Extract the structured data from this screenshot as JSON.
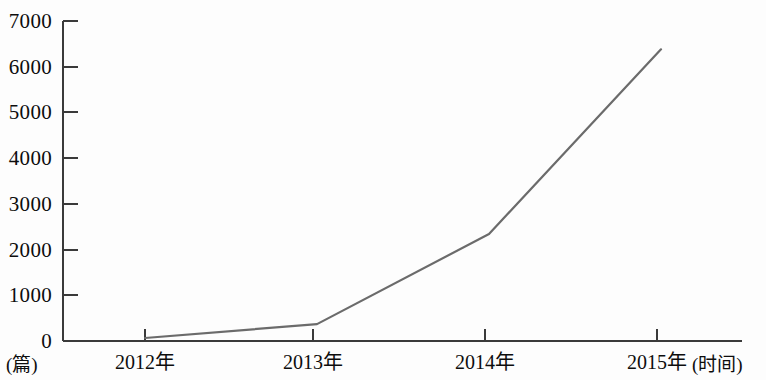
{
  "chart_data": {
    "type": "line",
    "title": "",
    "xlabel": "(时间)",
    "ylabel": "(篇)",
    "categories": [
      "2012年",
      "2013年",
      "2014年",
      "2015年"
    ],
    "values": [
      65,
      370,
      2340,
      6380
    ],
    "series": [
      {
        "name": "",
        "values": [
          65,
          370,
          2340,
          6380
        ]
      }
    ],
    "ylim": [
      0,
      7000
    ],
    "y_ticks": [
      0,
      1000,
      2000,
      3000,
      4000,
      5000,
      6000,
      7000
    ],
    "y_tick_labels": [
      "0",
      "1000",
      "2000",
      "3000",
      "4000",
      "5000",
      "6000",
      "7000"
    ],
    "x_tick_labels": [
      "2012年",
      "2013年",
      "2014年",
      "2015年"
    ],
    "grid": false,
    "legend": false,
    "legend_position": "none",
    "line_color": "#6b6b6b",
    "axis_color": "#3a3a3a",
    "background_color": "#fdfdfd"
  },
  "axis": {
    "y_unit": "(篇)",
    "x_unit": "(时间)"
  }
}
